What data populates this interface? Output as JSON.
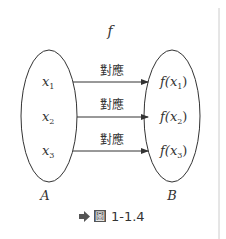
{
  "diagram": {
    "function_name": "f",
    "domain_set": {
      "name": "A",
      "elements": [
        "x",
        "x",
        "x"
      ],
      "subscripts": [
        "1",
        "2",
        "3"
      ]
    },
    "codomain_set": {
      "name": "B",
      "images": [
        {
          "prefix": "f(",
          "var": "x",
          "sub": "1",
          "suffix": ")"
        },
        {
          "prefix": "f(",
          "var": "x",
          "sub": "2",
          "suffix": ")"
        },
        {
          "prefix": "f(",
          "var": "x",
          "sub": "3",
          "suffix": ")"
        }
      ]
    },
    "mapping_labels": [
      "對應",
      "對應",
      "對應"
    ],
    "caption": {
      "icon": "arrow-right-icon",
      "figure_label": "圖",
      "number": "1-1.4"
    },
    "colors": {
      "stroke": "#333333",
      "text": "#333333",
      "icon": "#555555",
      "separator": "#cccccc"
    }
  }
}
